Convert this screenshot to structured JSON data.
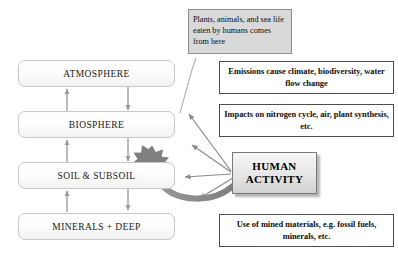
{
  "diagram": {
    "colors": {
      "sphere_border": "#c8c8c8",
      "note_gray_fill": "#d9d9d9",
      "note_border": "#4d4d4d",
      "arrow_thin": "#8a8a8a",
      "arrow_thick": "#8f8f8f",
      "starburst": "#808080",
      "human_box_border": "#7a7a7a"
    }
  },
  "spheres": [
    {
      "id": "atmosphere",
      "label": "ATMOSPHERE"
    },
    {
      "id": "biosphere",
      "label": "BIOSPHERE"
    },
    {
      "id": "soil",
      "label": "SOIL & SUBSOIL"
    },
    {
      "id": "minerals",
      "label": "MINERALS + DEEP"
    }
  ],
  "human_activity": {
    "line1": "HUMAN",
    "line2": "ACTIVITY"
  },
  "notes": [
    {
      "id": "food-source",
      "style": "gray",
      "text": "Plants, animals, and sea life eaten by humans comes from here"
    },
    {
      "id": "emissions",
      "style": "bold",
      "text": "Emissions cause climate, biodiversity, water flow change"
    },
    {
      "id": "impacts",
      "style": "bold",
      "text": "Impacts on nitrogen cycle, air, plant synthesis, etc."
    },
    {
      "id": "mined-materials",
      "style": "bold",
      "text": "Use of mined materials, e.g. fossil fuels, minerals, etc."
    }
  ],
  "connectors": {
    "vertical_pairs": [
      {
        "from": "biosphere",
        "to": "atmosphere",
        "direction": "up"
      },
      {
        "from": "atmosphere",
        "to": "biosphere",
        "direction": "down"
      },
      {
        "from": "soil",
        "to": "biosphere",
        "direction": "up"
      },
      {
        "from": "biosphere",
        "to": "soil",
        "direction": "down"
      },
      {
        "from": "minerals",
        "to": "soil",
        "direction": "up"
      },
      {
        "from": "soil",
        "to": "minerals",
        "direction": "down"
      }
    ],
    "impact_arrows": [
      {
        "from": "human_activity",
        "to": "atmosphere"
      },
      {
        "from": "human_activity",
        "to": "biosphere"
      },
      {
        "from": "human_activity",
        "to": "soil"
      }
    ],
    "extraction_arrow": {
      "from": "human_activity",
      "to": "soil",
      "style": "thick-curved"
    },
    "food_link": {
      "from": "food-source",
      "to": "biosphere",
      "style": "thin-curved"
    }
  }
}
